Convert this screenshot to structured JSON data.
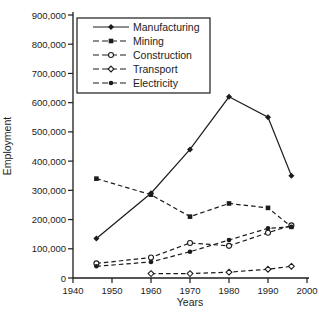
{
  "figure": {
    "background": "#ffffff",
    "ink_color": "#1c1c1c"
  },
  "chart_data": {
    "type": "line",
    "title": "",
    "xlabel": "Years",
    "ylabel": "Employment",
    "xlim": [
      1940,
      2000
    ],
    "ylim": [
      0,
      900000
    ],
    "grid": false,
    "x_ticks": [
      1940,
      1950,
      1960,
      1970,
      1980,
      1990,
      2000
    ],
    "x_tick_labels": [
      "1940",
      "1950",
      "1960",
      "1970",
      "1980",
      "1990",
      "2000"
    ],
    "y_ticks": [
      0,
      100000,
      200000,
      300000,
      400000,
      500000,
      600000,
      700000,
      800000,
      900000
    ],
    "y_tick_labels": [
      "0",
      "100,000",
      "200,000",
      "300,000",
      "400,000",
      "500,000",
      "600,000",
      "700,000",
      "800,000",
      "900,000"
    ],
    "legend": {
      "position": "top-left-inside",
      "entries": [
        "Manufacturing",
        "Mining",
        "Construction",
        "Transport",
        "Electricity"
      ]
    },
    "x": [
      1946,
      1960,
      1970,
      1980,
      1990,
      1996
    ],
    "series": [
      {
        "name": "Manufacturing",
        "line": "solid",
        "marker": "filled-diamond",
        "values": [
          135000,
          290000,
          440000,
          620000,
          550000,
          350000
        ]
      },
      {
        "name": "Mining",
        "line": "dashed",
        "marker": "filled-square",
        "values": [
          340000,
          285000,
          210000,
          255000,
          240000,
          175000
        ]
      },
      {
        "name": "Construction",
        "line": "dashed",
        "marker": "open-circle",
        "values": [
          50000,
          70000,
          120000,
          110000,
          155000,
          180000
        ]
      },
      {
        "name": "Transport",
        "line": "dashed",
        "marker": "open-diamond",
        "values": [
          null,
          15000,
          15000,
          20000,
          30000,
          40000
        ]
      },
      {
        "name": "Electricity",
        "line": "dashed",
        "marker": "filled-circle",
        "values": [
          40000,
          55000,
          90000,
          130000,
          170000,
          175000
        ]
      }
    ]
  }
}
